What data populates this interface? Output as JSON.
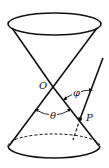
{
  "diagram": {
    "labels": {
      "vertex": "O",
      "point": "P",
      "cone_angle": "θ",
      "line_angle": "φ"
    },
    "colors": {
      "stroke": "#111111",
      "background": "#ffffff"
    }
  }
}
